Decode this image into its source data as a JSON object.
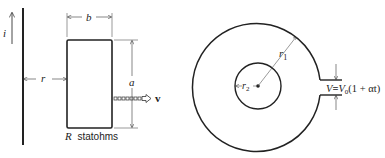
{
  "figure_left": {
    "current_label": "i",
    "distance_label": "r",
    "width_label": "b",
    "height_label": "a",
    "velocity_label": "v",
    "resistance_symbol": "R",
    "resistance_unit": "statohms"
  },
  "figure_right": {
    "outer_radius_label": "r",
    "outer_radius_sub": "1",
    "inner_radius_label": "r",
    "inner_radius_sub": "2",
    "voltage_lhs": "V",
    "voltage_eq": "=",
    "voltage_rhs_V": "V",
    "voltage_rhs_sub": "0",
    "voltage_rhs_expr": "(1 + αt)"
  },
  "colors": {
    "ink": "#222222",
    "background": "#ffffff"
  }
}
